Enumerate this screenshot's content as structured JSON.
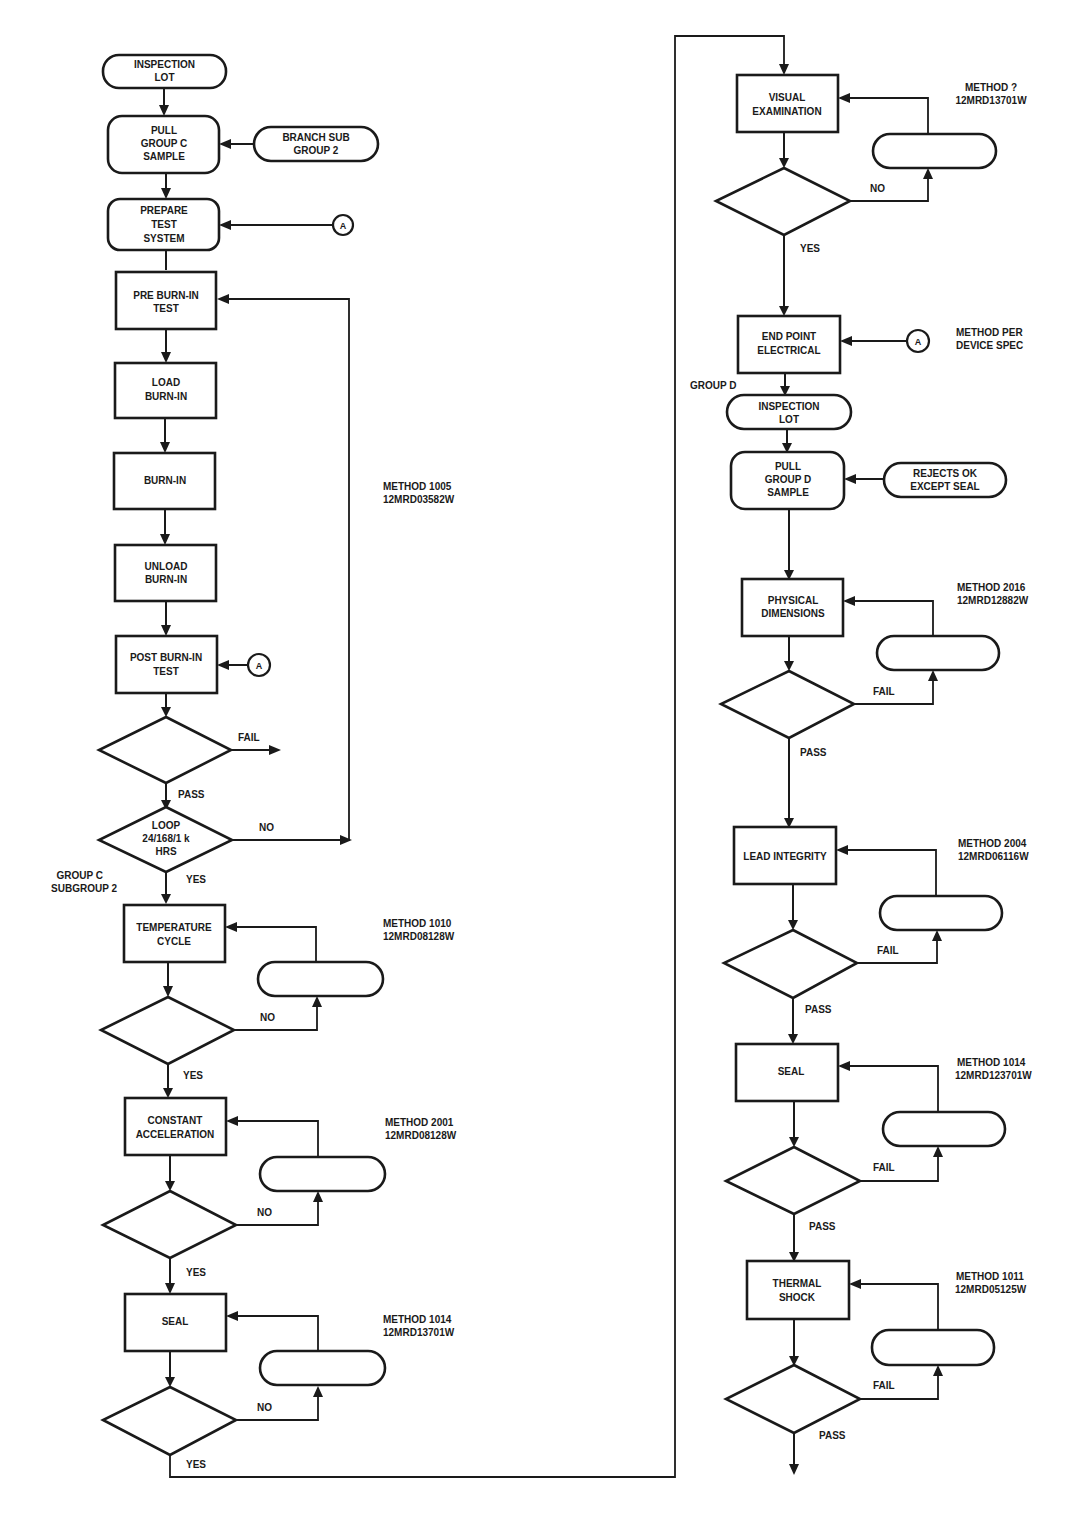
{
  "colors": {
    "ink": "#1a1a1a",
    "paper": "#ffffff"
  },
  "left_column": {
    "inspection_lot": [
      "INSPECTION",
      "LOT"
    ],
    "pull_group_c": [
      "PULL",
      "GROUP C",
      "SAMPLE"
    ],
    "branch_sub_group": [
      "BRANCH SUB",
      "GROUP 2"
    ],
    "prepare_test_system": [
      "PREPARE",
      "TEST",
      "SYSTEM"
    ],
    "connector_a": "A",
    "pre_burn_in_test": [
      "PRE BURN-IN",
      "TEST"
    ],
    "load_burn_in": [
      "LOAD",
      "BURN-IN"
    ],
    "burn_in": [
      "BURN-IN"
    ],
    "unload_burn_in": [
      "UNLOAD",
      "BURN-IN"
    ],
    "post_burn_in_test": [
      "POST BURN-IN",
      "TEST"
    ],
    "burn_in_method": [
      "METHOD 1005",
      "12MRD03582W"
    ],
    "fail_label": "FAIL",
    "pass_label": "PASS",
    "loop_decision": [
      "LOOP",
      "24/168/1 k",
      "HRS"
    ],
    "loop_no_label": "NO",
    "loop_yes_label": "YES",
    "group_c_subgroup_label": [
      "GROUP C",
      "SUBGROUP 2"
    ],
    "temperature_cycle": [
      "TEMPERATURE",
      "CYCLE"
    ],
    "temperature_cycle_method": [
      "METHOD 1010",
      "12MRD08128W"
    ],
    "constant_acceleration": [
      "CONSTANT",
      "ACCELERATION"
    ],
    "constant_acceleration_method": [
      "METHOD 2001",
      "12MRD08128W"
    ],
    "seal": [
      "SEAL"
    ],
    "seal_method": [
      "METHOD 1014",
      "12MRD13701W"
    ],
    "no_label": "NO",
    "yes_label": "YES"
  },
  "right_column": {
    "visual_examination": [
      "VISUAL",
      "EXAMINATION"
    ],
    "visual_examination_method": [
      "METHOD ?",
      "12MRD13701W"
    ],
    "no_label": "NO",
    "yes_label": "YES",
    "end_point_electrical": [
      "END POINT",
      "ELECTRICAL"
    ],
    "connector_a": "A",
    "end_point_method": [
      "METHOD PER",
      "DEVICE SPEC"
    ],
    "group_d_label": "GROUP D",
    "inspection_lot": [
      "INSPECTION",
      "LOT"
    ],
    "pull_group_d": [
      "PULL",
      "GROUP D",
      "SAMPLE"
    ],
    "rejects_ok": [
      "REJECTS OK",
      "EXCEPT SEAL"
    ],
    "physical_dimensions": [
      "PHYSICAL",
      "DIMENSIONS"
    ],
    "physical_dimensions_method": [
      "METHOD 2016",
      "12MRD12882W"
    ],
    "lead_integrity": [
      "LEAD INTEGRITY"
    ],
    "lead_integrity_method": [
      "METHOD 2004",
      "12MRD06116W"
    ],
    "seal": [
      "SEAL"
    ],
    "seal_method": [
      "METHOD 1014",
      "12MRD123701W"
    ],
    "thermal_shock": [
      "THERMAL",
      "SHOCK"
    ],
    "thermal_shock_method": [
      "METHOD 1011",
      "12MRD05125W"
    ],
    "fail_label": "FAIL",
    "pass_label": "PASS"
  }
}
